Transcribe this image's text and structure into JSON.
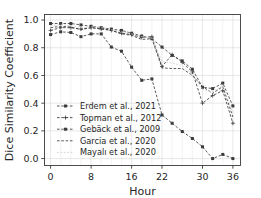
{
  "chart_data": {
    "type": "line",
    "title": "",
    "xlabel": "Hour",
    "ylabel": "Dice Similarity Coefficient",
    "xticks": [
      0,
      8,
      16,
      22,
      30,
      36
    ],
    "xticklabels": [
      "0",
      "8",
      "16",
      "22",
      "30",
      "36"
    ],
    "yticks": [
      0.0,
      0.2,
      0.4,
      0.6,
      0.8,
      1.0
    ],
    "yticklabels": [
      "0.0",
      "0.2",
      "0.4",
      "0.6",
      "0.8",
      "1.0"
    ],
    "xlim": [
      -1.2,
      37.5
    ],
    "ylim": [
      -0.05,
      1.04
    ],
    "grid": true,
    "legend_position": "lower left",
    "legend_frame": false,
    "x": [
      0,
      2,
      4,
      6,
      8,
      10,
      12,
      14,
      16,
      18,
      20,
      22,
      24,
      26,
      28,
      30,
      32,
      34,
      36
    ],
    "series": [
      {
        "name": "Erdem et al., 2021",
        "marker": "square",
        "linestyle": "dashed",
        "color": "#3c3c3c",
        "values": [
          0.975,
          0.975,
          0.975,
          0.965,
          0.955,
          0.945,
          0.935,
          0.925,
          0.905,
          0.885,
          0.865,
          0.805,
          0.745,
          0.705,
          0.645,
          0.515,
          0.505,
          0.545,
          0.38
        ]
      },
      {
        "name": "Topman et al., 2012",
        "marker": "plus",
        "linestyle": "dashed",
        "color": "#3c3c3c",
        "values": [
          0.925,
          0.945,
          0.945,
          0.935,
          0.945,
          0.935,
          0.925,
          0.905,
          0.895,
          0.875,
          0.88,
          0.665,
          0.75,
          0.695,
          0.625,
          0.4,
          0.455,
          0.49,
          0.255
        ]
      },
      {
        "name": "Gebäck et al., 2009",
        "marker": "square",
        "linestyle": "dashed",
        "color": "#3c3c3c",
        "values": [
          0.895,
          0.915,
          0.91,
          0.88,
          0.9,
          0.9,
          0.805,
          0.775,
          0.66,
          0.565,
          0.575,
          0.315,
          0.255,
          0.195,
          0.145,
          0.085,
          0.0,
          0.03,
          0.0
        ]
      },
      {
        "name": "Garcia et al., 2020",
        "marker": "none",
        "linestyle": "dashed",
        "color": "#3c3c3c",
        "values": [
          0.945,
          0.955,
          0.95,
          0.93,
          0.945,
          0.94,
          0.925,
          0.9,
          0.89,
          0.86,
          0.865,
          0.655,
          0.65,
          0.65,
          0.6,
          0.52,
          0.47,
          0.52,
          0.3
        ]
      },
      {
        "name": "Mayalı et al., 2020",
        "marker": "none",
        "linestyle": "dotted",
        "color": "#d5d5d5",
        "values": [
          0.96,
          0.965,
          0.96,
          0.945,
          0.95,
          0.945,
          0.93,
          0.915,
          0.9,
          0.88,
          0.87,
          0.7,
          0.69,
          0.67,
          0.61,
          0.5,
          0.48,
          0.53,
          0.33
        ]
      }
    ]
  }
}
